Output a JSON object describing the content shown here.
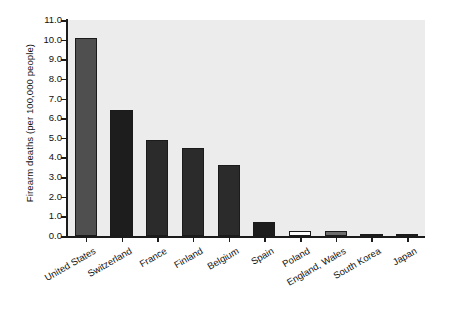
{
  "chart_data": {
    "type": "bar",
    "title": "",
    "xlabel": "",
    "ylabel": "Firearm deaths (per 100,000 people)",
    "categories": [
      "United States",
      "Switzerland",
      "France",
      "Finland",
      "Belgium",
      "Spain",
      "Poland",
      "England, Wales",
      "South Korea",
      "Japan"
    ],
    "values": [
      10.1,
      6.4,
      4.9,
      4.5,
      3.6,
      0.7,
      0.25,
      0.25,
      0.08,
      0.05
    ],
    "bar_colors": [
      "#4f4f4f",
      "#1d1d1d",
      "#2b2b2b",
      "#2b2b2b",
      "#2b2b2b",
      "#1d1d1d",
      "#ffffff",
      "#6d6d6d",
      "#1d1d1d",
      "#1d1d1d"
    ],
    "bar_edge_color": "#1b1b1b",
    "plot_background": "#ececec",
    "figure_background": "#ffffff",
    "ylim": [
      0.0,
      11.0
    ],
    "ytick_values": [
      0.0,
      1.0,
      2.0,
      3.0,
      4.0,
      5.0,
      6.0,
      7.0,
      8.0,
      9.0,
      10.0,
      11.0
    ],
    "ytick_labels": [
      "0.0",
      "1.0",
      "2.0",
      "3.0",
      "4.0",
      "5.0",
      "6.0",
      "7.0",
      "8.0",
      "9.0",
      "10.0",
      "11.0"
    ],
    "grid": false,
    "legend": null,
    "xtick_label_rotation": -30
  }
}
